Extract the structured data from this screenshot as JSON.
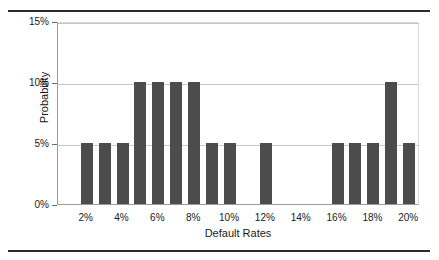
{
  "figure": {
    "top_rule": "horizontal-rule",
    "bottom_rule": "horizontal-rule"
  },
  "chart_data": {
    "type": "bar",
    "title": "",
    "xlabel": "Default Rates",
    "ylabel": "Probability",
    "categories": [
      "1%",
      "2%",
      "3%",
      "4%",
      "5%",
      "6%",
      "7%",
      "8%",
      "9%",
      "10%",
      "11%",
      "12%",
      "13%",
      "14%",
      "15%",
      "16%",
      "17%",
      "18%",
      "19%",
      "20%"
    ],
    "values": [
      0,
      5,
      5,
      5,
      10,
      10,
      10,
      10,
      5,
      5,
      0,
      5,
      0,
      0,
      0,
      5,
      5,
      5,
      10,
      5
    ],
    "x": [
      1,
      2,
      3,
      4,
      5,
      6,
      7,
      8,
      9,
      10,
      11,
      12,
      13,
      14,
      15,
      16,
      17,
      18,
      19,
      20
    ],
    "xlim": [
      0.4,
      20.6
    ],
    "ylim": [
      0,
      15
    ],
    "y_ticks": [
      0,
      5,
      10,
      15
    ],
    "y_tick_labels": [
      "0%",
      "5%",
      "10%",
      "15%"
    ],
    "x_ticks": [
      2,
      4,
      6,
      8,
      10,
      12,
      14,
      16,
      18,
      20
    ],
    "x_tick_labels": [
      "2%",
      "4%",
      "6%",
      "8%",
      "10%",
      "12%",
      "14%",
      "16%",
      "18%",
      "20%"
    ],
    "bar_color": "#4c4c4c",
    "grid": "horizontal",
    "legend": "none",
    "value_unit": "%"
  }
}
